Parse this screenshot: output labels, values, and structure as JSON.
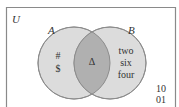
{
  "universe": {
    "label": "U"
  },
  "sets": [
    {
      "id": "A",
      "label": "A",
      "only_elements": [
        "#",
        "$"
      ]
    },
    {
      "id": "B",
      "label": "B",
      "only_elements": [
        "two",
        "six",
        "four"
      ]
    }
  ],
  "intersection": {
    "elements": [
      "Δ"
    ]
  },
  "outside": {
    "elements": [
      "10",
      "01"
    ]
  },
  "colors": {
    "border": "#8a8a8a",
    "circle_fill": "#dcdcdc",
    "circle_stroke": "#8c8c8c",
    "intersection_fill": "#b0b0b0",
    "text": "#333333"
  }
}
